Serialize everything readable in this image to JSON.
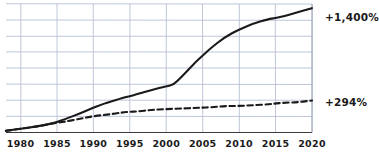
{
  "chart_data": {
    "type": "line",
    "title": "",
    "subtitle": "",
    "xlabel": "",
    "ylabel": "",
    "xlim": [
      1978,
      2020
    ],
    "ylim": [
      0,
      1500
    ],
    "grid": true,
    "legend_position": "right-end-labels",
    "x_ticks": [
      1980,
      1985,
      1990,
      1995,
      2000,
      2005,
      2010,
      2015,
      2020
    ],
    "x_tick_labels": [
      "1980",
      "1985",
      "1990",
      "1995",
      "2000",
      "2005",
      "2010",
      "2015",
      "2020"
    ],
    "y_gridline_count": 8,
    "series": [
      {
        "name": "solid-series",
        "style": "solid",
        "color": "#1a1a1a",
        "end_label": "+1,400%",
        "end_value": 1400,
        "x": [
          1978,
          1980,
          1982,
          1984,
          1985,
          1986,
          1988,
          1990,
          1991,
          1992,
          1994,
          1995,
          1996,
          1998,
          2000,
          2001,
          2002,
          2003,
          2004,
          2005,
          2006,
          2008,
          2010,
          2012,
          2014,
          2015,
          2016,
          2018,
          2020
        ],
        "values": [
          20,
          45,
          70,
          100,
          120,
          150,
          215,
          290,
          320,
          350,
          400,
          425,
          450,
          495,
          540,
          560,
          640,
          730,
          820,
          900,
          975,
          1110,
          1205,
          1275,
          1320,
          1335,
          1355,
          1400,
          1450
        ]
      },
      {
        "name": "dashed-series",
        "style": "dashed",
        "color": "#1a1a1a",
        "end_label": "+294%",
        "end_value": 294,
        "x": [
          1978,
          1980,
          1982,
          1984,
          1985,
          1986,
          1988,
          1990,
          1992,
          1994,
          1995,
          1996,
          1998,
          2000,
          2002,
          2004,
          2005,
          2006,
          2008,
          2010,
          2012,
          2014,
          2015,
          2016,
          2018,
          2020
        ],
        "values": [
          20,
          42,
          66,
          95,
          112,
          128,
          160,
          190,
          212,
          232,
          240,
          248,
          262,
          272,
          278,
          288,
          292,
          296,
          306,
          312,
          320,
          330,
          336,
          344,
          356,
          372
        ]
      }
    ]
  },
  "annotations": {
    "top_label": "+1,400%",
    "bottom_label": "+294%"
  },
  "axis": {
    "tick_labels": [
      "1980",
      "1985",
      "1990",
      "1995",
      "2000",
      "2005",
      "2010",
      "2015",
      "2020"
    ]
  }
}
